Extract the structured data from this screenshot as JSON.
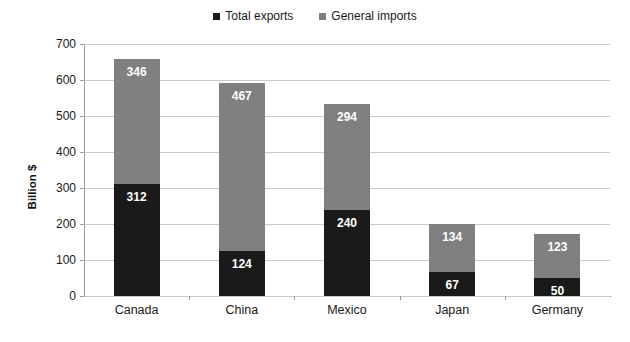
{
  "chart_data": {
    "type": "bar",
    "subtype": "stacked-bar",
    "title": "",
    "xlabel": "",
    "ylabel": "Billion $",
    "ylim": [
      0,
      700
    ],
    "ytick_step": 100,
    "yticks": [
      0,
      100,
      200,
      300,
      400,
      500,
      600,
      700
    ],
    "ytick_labels": [
      "0",
      "100",
      "200",
      "300",
      "400",
      "500",
      "600",
      "700"
    ],
    "grid": true,
    "legend_position": "top-center",
    "categories": [
      "Canada",
      "China",
      "Mexico",
      "Japan",
      "Germany"
    ],
    "series": [
      {
        "name": "Total exports",
        "color": "#1a1a1a",
        "values": [
          312,
          124,
          240,
          67,
          50
        ],
        "labels": [
          "312",
          "124",
          "240",
          "67",
          "50"
        ]
      },
      {
        "name": "General imports",
        "color": "#808080",
        "values": [
          346,
          467,
          294,
          134,
          123
        ],
        "labels": [
          "346",
          "467",
          "294",
          "134",
          "123"
        ]
      }
    ],
    "totals": [
      658,
      591,
      534,
      201,
      173
    ]
  },
  "legend": {
    "items": [
      {
        "label": "Total exports",
        "color": "#1a1a1a",
        "swatch": "square-marker-black"
      },
      {
        "label": "General imports",
        "color": "#808080",
        "swatch": "square-marker-gray"
      }
    ]
  },
  "axis": {
    "y_title": "Billion $"
  }
}
